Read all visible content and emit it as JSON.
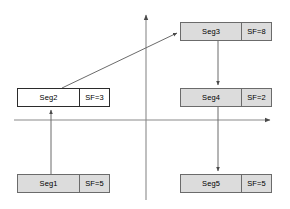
{
  "diagram": {
    "canvas": {
      "width": 290,
      "height": 209,
      "background": "#ffffff"
    },
    "colors": {
      "node_fill": "#dcdcdc",
      "node_fill_highlight": "#ffffff",
      "node_border": "#6b6b6b",
      "node_border_highlight": "#2b2b2b",
      "axis_line": "#7a7a7a",
      "arrow_line": "#6b6b6b",
      "text": "#000000"
    },
    "axes": {
      "vertical": {
        "x": 146,
        "y_top": 14,
        "y_bottom": 200,
        "arrow_at": "top"
      },
      "horizontal": {
        "y": 120,
        "x_left": 14,
        "x_right": 272,
        "arrow_at": "right"
      }
    },
    "nodes": [
      {
        "id": "seg1",
        "label": "Seg1",
        "sf_label": "SF=5",
        "x": 17,
        "y": 174,
        "w": 93,
        "h": 19,
        "highlight": false
      },
      {
        "id": "seg2",
        "label": "Seg2",
        "sf_label": "SF=3",
        "x": 17,
        "y": 88,
        "w": 93,
        "h": 19,
        "highlight": true
      },
      {
        "id": "seg3",
        "label": "Seg3",
        "sf_label": "SF=8",
        "x": 180,
        "y": 22,
        "w": 92,
        "h": 19,
        "highlight": false
      },
      {
        "id": "seg4",
        "label": "Seg4",
        "sf_label": "SF=2",
        "x": 180,
        "y": 88,
        "w": 92,
        "h": 19,
        "highlight": false
      },
      {
        "id": "seg5",
        "label": "Seg5",
        "sf_label": "SF=5",
        "x": 180,
        "y": 174,
        "w": 92,
        "h": 19,
        "highlight": false
      }
    ],
    "arrows": [
      {
        "id": "seg1-to-seg2",
        "from": "seg1",
        "to": "seg2",
        "x1": 51,
        "y1": 174,
        "x2": 51,
        "y2": 108
      },
      {
        "id": "seg2-to-seg3",
        "from": "seg2",
        "to": "seg3",
        "x1": 62,
        "y1": 88,
        "x2": 179,
        "y2": 32
      },
      {
        "id": "seg3-to-seg4",
        "from": "seg3",
        "to": "seg4",
        "x1": 218,
        "y1": 41,
        "x2": 218,
        "y2": 87
      },
      {
        "id": "seg4-to-seg5",
        "from": "seg4",
        "to": "seg5",
        "x1": 218,
        "y1": 107,
        "x2": 218,
        "y2": 173
      }
    ]
  }
}
